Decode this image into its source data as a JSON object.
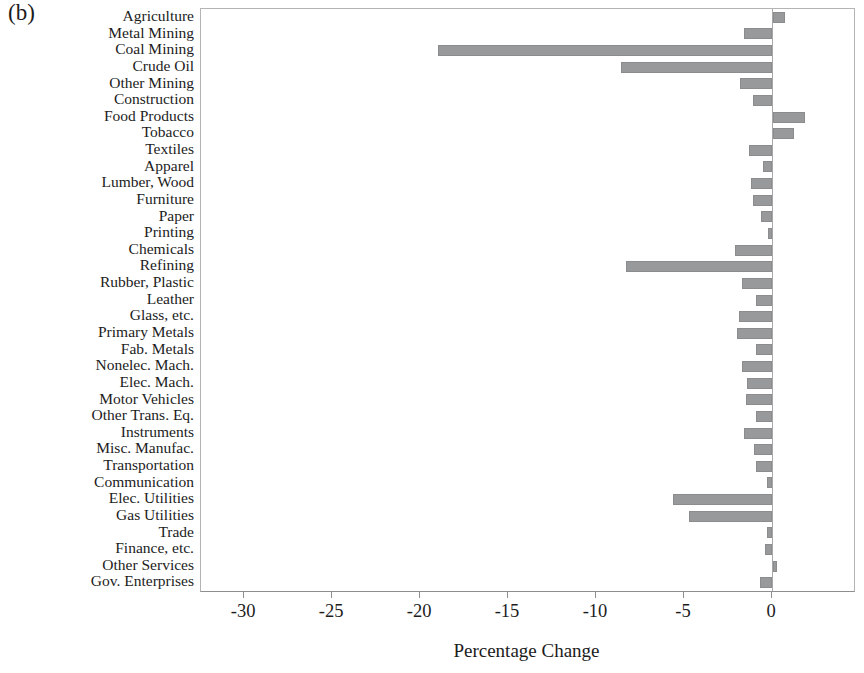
{
  "figure_label": "(b)",
  "chart_data": {
    "type": "bar",
    "orientation": "horizontal",
    "title": "",
    "xlabel": "Percentage Change",
    "ylabel": "",
    "categories": [
      "Agriculture",
      "Metal Mining",
      "Coal Mining",
      "Crude Oil",
      "Other Mining",
      "Construction",
      "Food Products",
      "Tobacco",
      "Textiles",
      "Apparel",
      "Lumber, Wood",
      "Furniture",
      "Paper",
      "Printing",
      "Chemicals",
      "Refining",
      "Rubber, Plastic",
      "Leather",
      "Glass, etc.",
      "Primary Metals",
      "Fab. Metals",
      "Nonelec. Mach.",
      "Elec. Mach.",
      "Motor Vehicles",
      "Other Trans. Eq.",
      "Instruments",
      "Misc. Manufac.",
      "Transportation",
      "Communication",
      "Elec. Utilities",
      "Gas Utilities",
      "Trade",
      "Finance, etc.",
      "Other Services",
      "Gov. Enterprises"
    ],
    "values": [
      0.7,
      -1.6,
      -19.0,
      -8.6,
      -1.8,
      -1.1,
      1.8,
      1.2,
      -1.3,
      -0.5,
      -1.2,
      -1.1,
      -0.6,
      -0.2,
      -2.1,
      -8.3,
      -1.7,
      -0.9,
      -1.9,
      -2.0,
      -0.9,
      -1.7,
      -1.4,
      -1.5,
      -0.9,
      -1.6,
      -1.0,
      -0.9,
      -0.3,
      -5.6,
      -4.7,
      -0.3,
      -0.4,
      0.2,
      -0.7
    ],
    "x_ticks": [
      -30,
      -25,
      -20,
      -15,
      -10,
      -5,
      0
    ],
    "x_tick_labels": [
      "-30",
      "-25",
      "-20",
      "-15",
      "-10",
      "-5",
      "0"
    ],
    "xlim": [
      -32.45,
      4.66
    ],
    "grid": false,
    "legend": "none",
    "bar_color": "#97999b",
    "bar_edge_color": "#8a8c8e",
    "frame_color": "#b4b4b4",
    "axis_color": "#8e8e8e",
    "zero_line_color": "#a8a8a8"
  }
}
